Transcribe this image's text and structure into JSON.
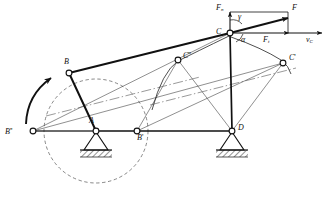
{
  "figure": {
    "type": "mechanism-kinematics-diagram",
    "background_color": "#ffffff",
    "line_color": "#1a1a1a"
  },
  "points": [
    {
      "id": "A",
      "label": "A",
      "prime": "",
      "x": 96,
      "y": 131,
      "kind": "pin-support",
      "note": "crank pivot, fixed ground support"
    },
    {
      "id": "B",
      "label": "B",
      "prime": "",
      "x": 69,
      "y": 73,
      "kind": "joint",
      "note": "crank pin, current position"
    },
    {
      "id": "Bp",
      "label": "B",
      "prime": "'",
      "x": 137,
      "y": 131,
      "kind": "joint",
      "note": "crank pin, position 1"
    },
    {
      "id": "Bpp",
      "label": "B",
      "prime": "''",
      "x": 33,
      "y": 131,
      "kind": "joint",
      "note": "crank pin, position 2"
    },
    {
      "id": "C",
      "label": "C",
      "prime": "",
      "x": 230,
      "y": 33,
      "kind": "joint",
      "note": "coupler / rocker joint, force application point"
    },
    {
      "id": "Cp",
      "label": "C",
      "prime": "'",
      "x": 283,
      "y": 63,
      "kind": "joint",
      "note": "joint C, position 1"
    },
    {
      "id": "Cpp",
      "label": "C",
      "prime": "''",
      "x": 178,
      "y": 60,
      "kind": "joint",
      "note": "joint C, position 2"
    },
    {
      "id": "D",
      "label": "D",
      "prime": "",
      "x": 232,
      "y": 131,
      "kind": "pin-support",
      "note": "rocker pivot, fixed ground support"
    }
  ],
  "links": [
    {
      "name": "crank-AB",
      "from": "A",
      "to": "B",
      "style": "heavy"
    },
    {
      "name": "coupler-BC",
      "from": "B",
      "to": "C",
      "style": "heavy"
    },
    {
      "name": "rocker-CD",
      "from": "C",
      "to": "D",
      "style": "heavy"
    },
    {
      "name": "ground-AD",
      "from": "A",
      "to": "D",
      "style": "heavy"
    },
    {
      "name": "ground-BppA",
      "from": "Bpp",
      "to": "A",
      "style": "medium"
    },
    {
      "name": "construction-BppC",
      "from": "Bpp",
      "to": "C",
      "style": "thin"
    },
    {
      "name": "construction-BppCp",
      "from": "Bpp",
      "to": "Cp",
      "style": "thin"
    },
    {
      "name": "construction-BpCpp",
      "from": "Bp",
      "to": "Cpp",
      "style": "thin"
    },
    {
      "name": "construction-BpCp",
      "from": "Bp",
      "to": "Cp",
      "style": "thin"
    },
    {
      "name": "construction-DCpp",
      "from": "D",
      "to": "Cpp",
      "style": "thin"
    },
    {
      "name": "construction-DCp",
      "from": "D",
      "to": "Cp",
      "style": "thin"
    }
  ],
  "crank_circle": {
    "name": "crank-path-circle",
    "center": "A",
    "cx": 96,
    "cy": 131,
    "r": 52,
    "stroke": "dashed",
    "note": "locus of crank pin B"
  },
  "rotation_arrow": {
    "name": "rotation-direction-arrow",
    "note": "curved arrow indicating crank rotation sense (counter-clockwise shown at left)"
  },
  "arcs": [
    {
      "name": "arc-C-to-Cpp",
      "note": "swing arc of point C toward C''"
    },
    {
      "name": "arc-C-to-Cp",
      "note": "swing arc of point C toward C'"
    }
  ],
  "forces": {
    "resultant": {
      "label": "F",
      "name": "force-F",
      "note": "resultant force applied at C, directed up-right"
    },
    "normal_component": {
      "label": "F",
      "sub": "n",
      "name": "force-Fn",
      "note": "component of F perpendicular to CD (vertical, upward)"
    },
    "tangential_component": {
      "label": "F",
      "sub": "t",
      "name": "force-Ft",
      "note": "component of F along velocity direction (horizontal, to the right)"
    }
  },
  "velocity": {
    "label": "v",
    "sub": "C",
    "name": "velocity-vC",
    "note": "velocity of point C, horizontal, to the right"
  },
  "angles": [
    {
      "label": "γ",
      "name": "angle-gamma",
      "x": 238,
      "y": 16,
      "note": "angle between F and Fn at C"
    },
    {
      "label": "α",
      "name": "angle-alpha",
      "x": 241,
      "y": 38,
      "note": "angle between F and vC at C"
    }
  ],
  "supports": [
    {
      "name": "ground-support-A",
      "at": "A",
      "type": "pinned-hatched"
    },
    {
      "name": "ground-support-D",
      "at": "D",
      "type": "pinned-hatched"
    }
  ]
}
